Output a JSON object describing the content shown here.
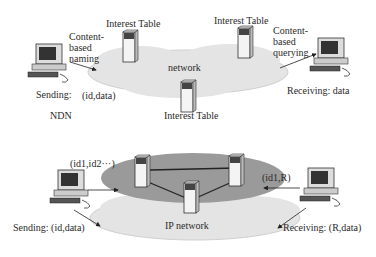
{
  "ndn": {
    "section_label": "NDN",
    "cloud_label": "network",
    "interest_tables": [
      "Interest Table",
      "Interest Table",
      "Interest Table"
    ],
    "sender_annotation": "Content-based naming",
    "sender_label": "Sending:",
    "sender_payload": "(id,data)",
    "receiver_annotation": "Content-based querying",
    "receiver_label": "Receiving: data"
  },
  "ip": {
    "cloud_label": "IP network",
    "sender_id_list": "(id1,id2···)",
    "sender_label": "Sending: (id,data)",
    "receiver_request": "(id1,R)",
    "receiver_label": "Receiving: (R,data)"
  },
  "colors": {
    "cloud_fill": "#e4e4e4",
    "cloud_edge": "#c8c8c8",
    "ellipse_fill": "#9a9a9a",
    "server_fill": "#f4f4f4",
    "line": "#222222"
  }
}
